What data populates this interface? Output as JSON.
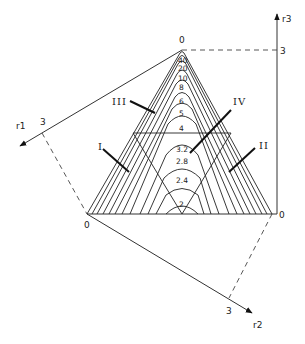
{
  "diagram": {
    "type": "ternary-contour-diagram",
    "axes": [
      {
        "name": "r1",
        "tick_label": "3",
        "origin_label": "0"
      },
      {
        "name": "r2",
        "tick_label": "3",
        "origin_label": "0"
      },
      {
        "name": "r3",
        "tick_label": "3",
        "origin_label": "0"
      }
    ],
    "vertices": {
      "apex_label": "0",
      "left_label": "0",
      "right_label": "0"
    },
    "contour_labels": [
      "40",
      "20",
      "10",
      "8",
      "6",
      "5",
      "4",
      "3.2",
      "2.8",
      "2.4",
      "2"
    ],
    "regions": [
      {
        "label": "I"
      },
      {
        "label": "II"
      },
      {
        "label": "III"
      },
      {
        "label": "IV"
      }
    ],
    "colors": {
      "line": "#222222",
      "background": "#ffffff"
    }
  }
}
